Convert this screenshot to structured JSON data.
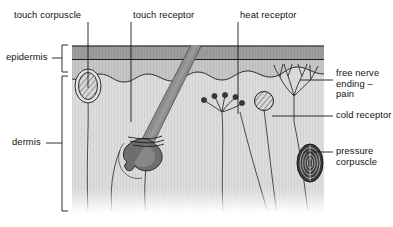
{
  "figure": {
    "background_color": "#ffffff",
    "line_color": "#1a1a1a",
    "text_color": "#111111"
  },
  "layers": {
    "epidermis_label": "epidermis",
    "dermis_label": "dermis",
    "epidermis_top_band_color": "#9a9a9a",
    "epidermis_lower_band_color": "#c2c2c2",
    "dermis_color": "#d9d9d9",
    "panel_left": 72,
    "panel_right": 324,
    "panel_top": 45,
    "panel_bottom": 213
  },
  "labels": {
    "top": [
      {
        "name": "touch-corpuscle",
        "text": "touch corpuscle",
        "x": 14,
        "y": 10
      },
      {
        "name": "touch-receptor",
        "text": "touch receptor",
        "x": 133,
        "y": 10
      },
      {
        "name": "heat-receptor",
        "text": "heat receptor",
        "x": 240,
        "y": 10
      }
    ],
    "left": [
      {
        "name": "epidermis",
        "text": "epidermis",
        "x": 6,
        "y": 52
      },
      {
        "name": "dermis",
        "text": "dermis",
        "x": 12,
        "y": 137
      }
    ],
    "right": [
      {
        "name": "free-nerve-ending-pain",
        "text": "free nerve ending – pain",
        "x": 336,
        "y": 74
      },
      {
        "name": "cold-receptor",
        "text": "cold receptor",
        "x": 336,
        "y": 110
      },
      {
        "name": "pressure-corpuscle",
        "text": "pressure corpuscle",
        "x": 336,
        "y": 146
      }
    ]
  },
  "structures": {
    "touch_corpuscle": {
      "label": "touch corpuscle",
      "cx": 88,
      "cy": 86,
      "rx": 11,
      "ry": 15
    },
    "hair_follicle": {
      "label": "touch receptor",
      "shaft_color": "#8d8d8d",
      "bulb_color": "#6e6e6e"
    },
    "heat_receptor": {
      "label": "heat receptor",
      "bulb_count": 5
    },
    "cold_receptor": {
      "label": "cold receptor",
      "cx": 264,
      "cy": 101,
      "r": 9
    },
    "free_nerve_ending": {
      "label": "free nerve ending – pain",
      "cx": 294,
      "cy": 96
    },
    "pressure_corpuscle": {
      "label": "pressure corpuscle",
      "cx": 310,
      "cy": 163,
      "rx": 13,
      "ry": 19,
      "ring_count": 5
    }
  }
}
